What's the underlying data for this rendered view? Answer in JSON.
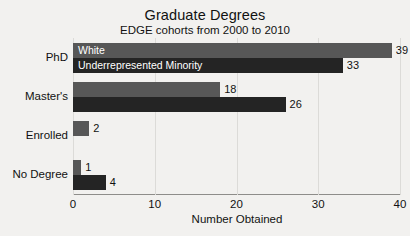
{
  "chart_data": {
    "type": "bar",
    "orientation": "horizontal",
    "title": "Graduate Degrees",
    "subtitle": "EDGE cohorts from 2000 to 2010",
    "xlabel": "Number Obtained",
    "ylabel": "",
    "xlim": [
      0,
      40
    ],
    "xticks": [
      0,
      10,
      20,
      30,
      40
    ],
    "grid": true,
    "legend_position": "inside-first-group",
    "categories": [
      "PhD",
      "Master's",
      "Enrolled",
      "No Degree"
    ],
    "series": [
      {
        "name": "White",
        "color": "#575757",
        "values": [
          39,
          18,
          2,
          1
        ]
      },
      {
        "name": "Underrepresented Minority",
        "color": "#242424",
        "values": [
          33,
          26,
          0,
          4
        ]
      }
    ]
  },
  "colors": {
    "background": "#f2f1ef",
    "series_white": "#575757",
    "series_urm": "#242424",
    "axis": "#8e8d8a",
    "grid": "#dcdbd8",
    "text": "#111111",
    "inline_label_text": "#ffffff"
  }
}
